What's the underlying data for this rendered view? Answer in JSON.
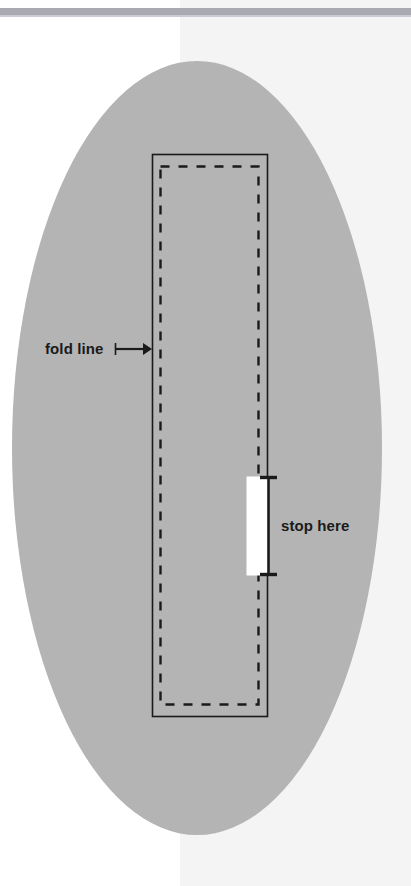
{
  "diagram": {
    "background": {
      "page_color": "#ffffff",
      "panel_color": "#f4f4f4",
      "panel_left_x": 180,
      "top_rule_color": "#a8aab0",
      "top_rule_y": 8,
      "top_rule_height": 7
    },
    "shapes": {
      "ellipse": {
        "name": "fabric-oval",
        "fill": "#b4b4b4",
        "cx": 197,
        "cy": 448,
        "rx": 185,
        "ry": 387
      },
      "solid_rectangle": {
        "name": "fold-rectangle",
        "stroke": "#1a1a1a",
        "x": 152,
        "y": 154,
        "width": 115,
        "height": 562
      },
      "dashed_rectangle": {
        "name": "stitch-line",
        "stroke": "#1a1a1a",
        "x": 160,
        "y": 166,
        "width": 98,
        "height": 538,
        "dash": "9 9"
      },
      "gap_rectangle": {
        "name": "opening-gap",
        "fill": "#ffffff",
        "x": 248,
        "y": 477,
        "width": 19,
        "height": 98
      }
    },
    "annotations": [
      {
        "name": "fold-line-annotation",
        "label": "fold line",
        "text_x": 45,
        "text_y": 354,
        "leader_start_x": 115,
        "leader_end_x": 150,
        "leader_y": 349,
        "arrow": "right",
        "tick": "left-vertical"
      },
      {
        "name": "stop-here-annotation",
        "label": "stop here",
        "text_x": 281,
        "text_y": 526,
        "bracket_x": 268,
        "bracket_top_y": 477,
        "bracket_bottom_y": 575,
        "tick_half_width": 8
      }
    ]
  }
}
